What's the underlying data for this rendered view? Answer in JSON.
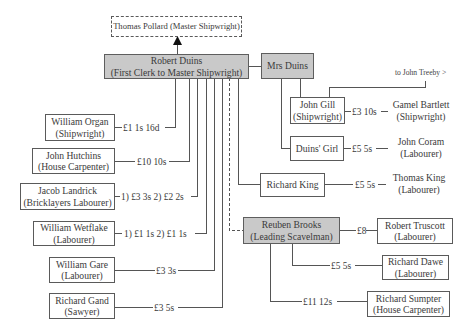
{
  "diagram": {
    "master": {
      "name": "Thomas Pollard (Master Shipwright)"
    },
    "clerk": {
      "name": "Robert Duins",
      "role": "(First Clerk to Master Shipwright)"
    },
    "wife": {
      "name": "Mrs Duins"
    },
    "john_gill": {
      "name": "John Gill",
      "role": "(Shipwright)"
    },
    "duins_girl": {
      "name": "Duins' Girl"
    },
    "richard_king": {
      "name": "Richard King"
    },
    "reuben_brooks": {
      "name": "Reuben Brooks",
      "role": "(Leading Scavelman)"
    },
    "robert_truscott": {
      "name": "Robert Truscott",
      "role": "(Labourer)"
    },
    "richard_dawe": {
      "name": "Richard Dawe",
      "role": "(Labourer)"
    },
    "richard_sumpter": {
      "name": "Richard Sumpter",
      "role": "(House Carpenter)"
    },
    "gamel_bartlett": {
      "name": "Gamel Bartlett",
      "role": "(Shipwright)"
    },
    "john_coram": {
      "name": "John Coram",
      "role": "(Labourer)"
    },
    "thomas_king": {
      "name": "Thomas King",
      "role": "(Labourer)"
    },
    "william_organ": {
      "name": "William Organ",
      "role": "(Shipwright)"
    },
    "john_hutchins": {
      "name": "John Hutchins",
      "role": "(House Carpenter)"
    },
    "jacob_landrick": {
      "name": "Jacob Landrick",
      "role": "(Bricklayers Labourer)"
    },
    "william_wetflake": {
      "name": "William Wetflake",
      "role": "(Labourer)"
    },
    "william_gare": {
      "name": "William Gare",
      "role": "(Labourer)"
    },
    "richard_gand": {
      "name": "Richard Gand",
      "role": "(Sawyer)"
    },
    "treeby_note": "to John Treeby >",
    "wages": {
      "william_organ": "£1 1s 16d",
      "john_hutchins": "£10 10s",
      "jacob_landrick": "1) £3 3s 2) £2 2s",
      "william_wetflake": "1) £1 1s 2) £1 1s",
      "william_gare": "£3 3s",
      "richard_gand": "£3 5s",
      "gamel_bartlett": "£3 10s",
      "john_coram": "£5 5s",
      "thomas_king": "£5 5s",
      "robert_truscott": "£8",
      "richard_dawe": "£5 5s",
      "richard_sumpter": "£11 12s"
    },
    "colors": {
      "highlight_fill": "#c9c9c9",
      "line": "#555555",
      "text": "#3a3a3a"
    }
  }
}
